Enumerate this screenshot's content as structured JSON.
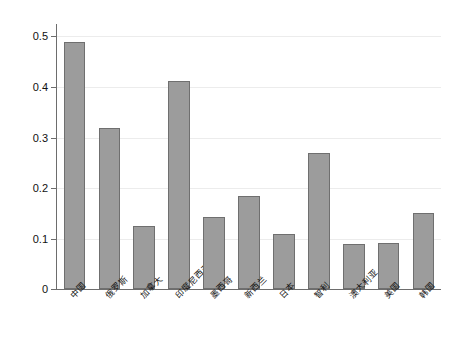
{
  "chart_data": {
    "type": "bar",
    "title": "",
    "subtitle": "",
    "xlabel": "",
    "ylabel": "",
    "categories": [
      "中国",
      "俄罗斯",
      "加拿大",
      "印度尼西亚",
      "墨西哥",
      "新西兰",
      "日本",
      "智利",
      "澳大利亚",
      "美国",
      "韩国"
    ],
    "values": [
      0.488,
      0.319,
      0.124,
      0.411,
      0.143,
      0.183,
      0.108,
      0.268,
      0.089,
      0.09,
      0.15
    ],
    "ylim": [
      0,
      0.5
    ],
    "yticks": [
      0,
      0.1,
      0.2,
      0.3,
      0.4,
      0.5
    ],
    "ytick_labels": [
      "0",
      "0.1",
      "0.2",
      "0.3",
      "0.4",
      "0.5"
    ],
    "grid": true,
    "grid_axis": "y",
    "legend": false,
    "legend_position": "none",
    "bar_fill_color": "#9c9c9c",
    "bar_edge_color": "#6f6f6f",
    "grid_color": "#ececec",
    "axis_color": "#6d6d6d",
    "text_color": "#111111",
    "background_color": "#ffffff",
    "xtick_rotation": -45,
    "series": [
      {
        "name": "series-1",
        "values": [
          0.488,
          0.319,
          0.124,
          0.411,
          0.143,
          0.183,
          0.108,
          0.268,
          0.089,
          0.09,
          0.15
        ]
      }
    ],
    "annotations": []
  }
}
